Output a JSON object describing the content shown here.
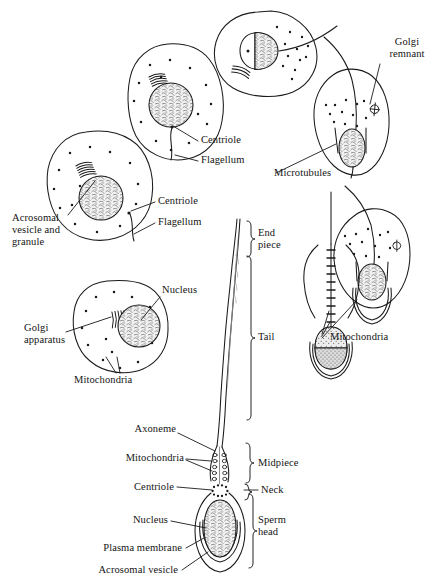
{
  "figure": {
    "ink_color": "#1a1a1a",
    "background_color": "#ffffff",
    "nucleus_fill": "#e8e8e8",
    "acrosome_fill": "#cfcfcf"
  },
  "labels": {
    "golgi_remnant": "Golgi\nremnant",
    "microtubules": "Microtubules",
    "centriole_top": "Centriole",
    "flagellum_top": "Flagellum",
    "centriole_mid": "Centriole",
    "flagellum_mid": "Flagellum",
    "acrosomal_vesicle_and_granule": "Acrosomal\nvesicle and\ngranule",
    "nucleus_left": "Nucleus",
    "golgi_apparatus": "Golgi\napparatus",
    "mitochondria_left": "Mitochondria",
    "mitochondria_right": "Mitochondria",
    "end_piece": "End\npiece",
    "tail": "Tail",
    "midpiece": "Midpiece",
    "neck": "Neck",
    "sperm_head": "Sperm\nhead",
    "axoneme": "Axoneme",
    "mitochondria_sperm": "Mitochondria",
    "centriole_sperm": "Centriole",
    "nucleus_sperm": "Nucleus",
    "plasma_membrane": "Plasma membrane",
    "acrosomal_vesicle_sperm": "Acrosomal vesicle"
  }
}
